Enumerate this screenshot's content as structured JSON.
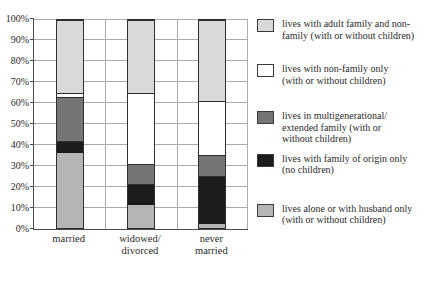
{
  "chart_data": {
    "type": "bar",
    "stacked": true,
    "title": "",
    "xlabel": "",
    "ylabel": "",
    "categories": [
      "married",
      "widowed/\ndivorced",
      "never\nmarried"
    ],
    "series": [
      {
        "name": "lives alone or with husband only (with or without children)",
        "color": "#b5b5b5",
        "values": [
          36,
          11,
          2
        ]
      },
      {
        "name": "lives with family of origin only (no children)",
        "color": "#1c1c1c",
        "values": [
          6,
          10,
          23
        ]
      },
      {
        "name": "lives in multigenerational/extended family (with or without children)",
        "color": "#757575",
        "values": [
          21,
          10,
          10
        ]
      },
      {
        "name": "lives with non-family only (with or without children)",
        "color": "#ffffff",
        "values": [
          2,
          34,
          26
        ]
      },
      {
        "name": "lives with adult family and non-family (with or without children)",
        "color": "#d9d9d9",
        "values": [
          35,
          35,
          39
        ]
      }
    ],
    "ylim": [
      0,
      100
    ],
    "ytick_step": 10,
    "ytick_suffix": "%",
    "grid": true,
    "legend_position": "right",
    "legend": [
      {
        "label": "lives with adult family and non-\nfamily (with or without children)",
        "color": "#d9d9d9"
      },
      {
        "label": "lives with  non-family only\n(with or without children)",
        "color": "#ffffff"
      },
      {
        "label": "lives in multigenerational/\nextended family (with or\nwithout children)",
        "color": "#757575"
      },
      {
        "label": "lives with  family of origin only\n(no children)",
        "color": "#1c1c1c"
      },
      {
        "label": "lives alone or with husband only\n(with or without children)",
        "color": "#b5b5b5"
      }
    ]
  },
  "colors": {
    "background": "#ffffff",
    "grid": "#ababab",
    "axis": "#4a4a4a",
    "bar_border": "#2f2f2f",
    "text": "#2b2b2b"
  }
}
